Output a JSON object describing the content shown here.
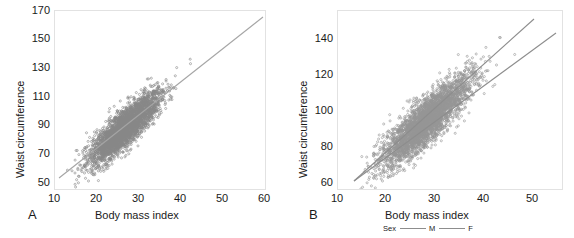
{
  "figure": {
    "background": "#ffffff",
    "point_color": "#5a5a5a",
    "line_color": "#9a9a9a",
    "axis_color": "#e2e2e2"
  },
  "panels": [
    {
      "letter": "A",
      "xlabel": "Body mass index",
      "ylabel": "Waist circumference",
      "xticks": [
        "10",
        "20",
        "30",
        "40",
        "50",
        "60"
      ],
      "yticks": [
        "50",
        "70",
        "90",
        "110",
        "130",
        "150",
        "170"
      ]
    },
    {
      "letter": "B",
      "xlabel": "Body mass index",
      "ylabel": "Waist circumference",
      "xticks": [
        "10",
        "20",
        "30",
        "40",
        "50"
      ],
      "yticks": [
        "60",
        "80",
        "100",
        "120",
        "140"
      ]
    }
  ],
  "legend": {
    "title": "Sex",
    "entries": [
      {
        "label": "M",
        "color": "#8d8d8d"
      },
      {
        "label": "F",
        "color": "#8d8d8d"
      }
    ]
  },
  "chart_data": [
    {
      "type": "scatter",
      "panel": "A",
      "title": "",
      "xlabel": "Body mass index",
      "ylabel": "Waist circumference",
      "xlim": [
        10,
        60
      ],
      "ylim": [
        50,
        170
      ],
      "xticks": [
        10,
        20,
        30,
        40,
        50,
        60
      ],
      "yticks": [
        50,
        70,
        90,
        110,
        130,
        150,
        170
      ],
      "grid": false,
      "legend_position": "none",
      "n_points_approx": 2000,
      "marker": "open-circle",
      "marker_color": "#5a5a5a",
      "description": "Pooled scatter of waist circumference against body mass index with a single fitted regression line.",
      "series": [
        {
          "name": "All",
          "color": "#5a5a5a",
          "regression_line": {
            "x": [
              13.0,
              57.5
            ],
            "y": [
              59.0,
              168.0
            ],
            "slope": 2.45,
            "intercept": 27.2,
            "color": "#9a9a9a"
          }
        }
      ]
    },
    {
      "type": "scatter",
      "panel": "B",
      "title": "",
      "xlabel": "Body mass index",
      "ylabel": "Waist circumference",
      "xlim": [
        10,
        54
      ],
      "ylim": [
        58,
        152
      ],
      "xticks": [
        10,
        20,
        30,
        40,
        50
      ],
      "yticks": [
        60,
        80,
        100,
        120,
        140
      ],
      "grid": false,
      "legend_position": "bottom",
      "n_points_approx": 2000,
      "marker": "open-circle",
      "marker_color": "#5a5a5a",
      "description": "Scatter of waist circumference against body mass index with separate fitted regression lines for males and females; the male line is steeper and lies above the female line at high BMI.",
      "series": [
        {
          "name": "M",
          "color": "#8d8d8d",
          "regression_line": {
            "x": [
              13.5,
              48.5
            ],
            "y": [
              62.5,
              151.0
            ],
            "slope": 2.53,
            "intercept": 28.4,
            "color": "#8d8d8d"
          }
        },
        {
          "name": "F",
          "color": "#8d8d8d",
          "regression_line": {
            "x": [
              13.5,
              52.5
            ],
            "y": [
              62.5,
              145.5
            ],
            "slope": 2.13,
            "intercept": 33.8,
            "color": "#8d8d8d"
          }
        }
      ]
    }
  ]
}
